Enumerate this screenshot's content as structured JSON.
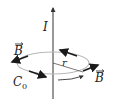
{
  "diagram": {
    "labels": {
      "current": "I",
      "field_left": "B",
      "field_right": "B",
      "radius": "r",
      "curve": "C",
      "curve_subscript": "0"
    },
    "colors": {
      "wire": "#333333",
      "loop": "#b8b8b8",
      "arrow": "#1a1a1a",
      "text": "#222222",
      "background": "#ffffff"
    }
  }
}
